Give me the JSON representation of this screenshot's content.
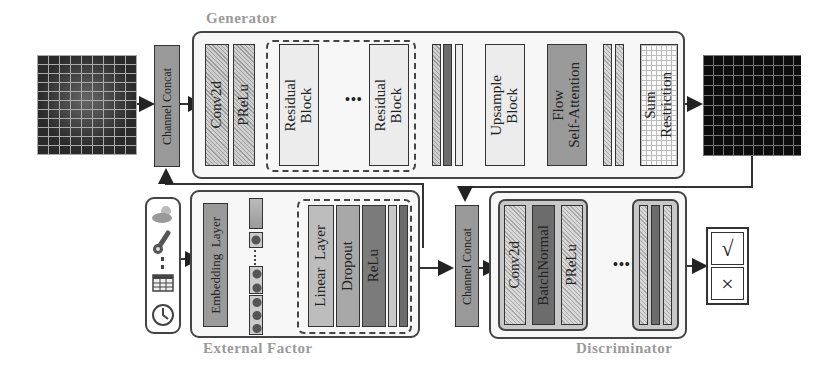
{
  "generator": {
    "title": "Generator",
    "channel_concat": "Channel Concat",
    "conv": "Conv2d",
    "prelu": "PReLu",
    "residual_block_1": "Residual\nBlock",
    "residual_ellipsis": "•••",
    "residual_block_2": "Residual\nBlock",
    "upsample": "Upsample\nBlock",
    "attention": "Flow\nSelf-Attention",
    "sum_restriction": "Sum\nRestriction"
  },
  "external_factor": {
    "title": "External Factor",
    "inputs": [
      "weather-icon",
      "thermometer-icon",
      "calendar-icon",
      "clock-icon"
    ],
    "embedding": "Embedding  Layer",
    "linear": "Linear  Layer",
    "dropout": "Dropout",
    "relu": "ReLu"
  },
  "discriminator": {
    "title": "Discriminator",
    "channel_concat": "Channel Concat",
    "conv": "Conv2d",
    "batchnorm": "BatchNormal",
    "prelu": "PReLu",
    "ellipsis": "•••",
    "output_real": "√",
    "output_fake": "×"
  },
  "images": {
    "input_map": "coarse-grained flow map",
    "output_map": "fine-grained flow map"
  }
}
